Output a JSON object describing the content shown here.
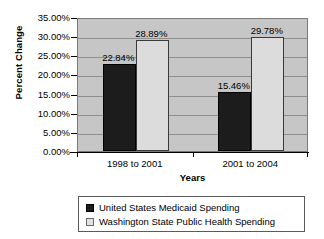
{
  "chart_data": {
    "type": "bar",
    "title": "",
    "xlabel": "Years",
    "ylabel": "Percent Change",
    "categories": [
      "1998 to 2001",
      "2001 to 2004"
    ],
    "series": [
      {
        "name": "United States Medicaid Spending",
        "color": "#1c1c1c",
        "values": [
          22.84,
          15.46
        ],
        "labels": [
          "22.84%",
          "15.46%"
        ]
      },
      {
        "name": "Washington State Public Health Spending",
        "color": "#dcdcdc",
        "values": [
          28.89,
          29.78
        ],
        "labels": [
          "28.89%",
          "29.78%"
        ]
      }
    ],
    "ylim": [
      0,
      35
    ],
    "ytick_step": 5,
    "ytick_labels": [
      "0.00%",
      "5.00%",
      "10.00%",
      "15.00%",
      "20.00%",
      "25.00%",
      "30.00%",
      "35.00%"
    ],
    "ytick_values": [
      0,
      5,
      10,
      15,
      20,
      25,
      30,
      35
    ],
    "grid": true,
    "legend_position": "bottom",
    "plot_background": "#c6c6c6"
  },
  "legend": {
    "items": [
      {
        "label": "United States Medicaid Spending"
      },
      {
        "label": "Washington State Public Health Spending"
      }
    ]
  }
}
